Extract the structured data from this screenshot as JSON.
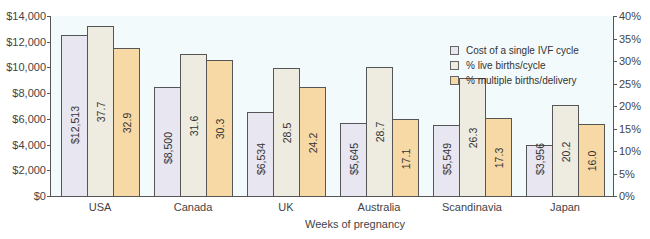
{
  "chart_data": {
    "type": "bar",
    "title": "",
    "xlabel": "Weeks of pregnancy",
    "ylabel": "",
    "categories": [
      "USA",
      "Canada",
      "UK",
      "Australia",
      "Scandinavia",
      "Japan"
    ],
    "series": [
      {
        "name": "Cost of a single IVF cycle",
        "axis": "left",
        "color": "#e7e6f1",
        "values": [
          12513,
          8500,
          6534,
          5645,
          5549,
          3956
        ],
        "labels": [
          "$12,513",
          "$8,500",
          "$6,534",
          "$5,645",
          "$5,549",
          "$3,956"
        ]
      },
      {
        "name": "% live births/cycle",
        "axis": "right",
        "color": "#eeebe0",
        "values": [
          37.7,
          31.6,
          28.5,
          28.7,
          26.3,
          20.2
        ],
        "labels": [
          "37.7",
          "31.6",
          "28.5",
          "28.7",
          "26.3",
          "20.2"
        ]
      },
      {
        "name": "% multiple births/delivery",
        "axis": "right",
        "color": "#f7d9a6",
        "values": [
          32.9,
          30.3,
          24.2,
          17.1,
          17.3,
          16.0
        ],
        "labels": [
          "32.9",
          "30.3",
          "24.2",
          "17.1",
          "17.3",
          "16.0"
        ]
      }
    ],
    "y_left": {
      "ylim": [
        0,
        14000
      ],
      "ticks": [
        "$0",
        "$2,000",
        "$4,000",
        "$6,000",
        "$8,000",
        "$10,000",
        "$12,000",
        "$14,000"
      ]
    },
    "y_right": {
      "ylim": [
        0,
        40
      ],
      "ticks": [
        "0%",
        "5%",
        "10%",
        "15%",
        "20%",
        "25%",
        "30%",
        "35%",
        "40%"
      ]
    },
    "grid": false,
    "legend_position": "upper right"
  },
  "legend": {
    "items": [
      {
        "label": "Cost of a single IVF cycle"
      },
      {
        "label": "% live births/cycle"
      },
      {
        "label": "% multiple births/delivery"
      }
    ]
  }
}
